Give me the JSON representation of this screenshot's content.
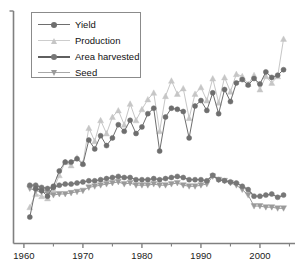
{
  "chart_data": {
    "type": "line",
    "title": "",
    "xlabel": "",
    "ylabel": "",
    "xlim": [
      1959.0,
      2005.6
    ],
    "ylim": [
      0,
      100
    ],
    "grid": false,
    "legend_position": "top-left",
    "x_tick_labels": [
      "1960",
      "1970",
      "1980",
      "1990",
      "2000"
    ],
    "x_ticks": [
      1960,
      1970,
      1980,
      1990,
      2000
    ],
    "x_minor_ticks": [
      1965,
      1975,
      1985,
      1995,
      2005
    ],
    "y_tick_labels": [],
    "x": [
      1961,
      1962,
      1963,
      1964,
      1965,
      1966,
      1967,
      1968,
      1969,
      1970,
      1971,
      1972,
      1973,
      1974,
      1975,
      1976,
      1977,
      1978,
      1979,
      1980,
      1981,
      1982,
      1983,
      1984,
      1985,
      1986,
      1987,
      1988,
      1989,
      1990,
      1991,
      1992,
      1993,
      1994,
      1995,
      1996,
      1997,
      1998,
      1999,
      2000,
      2001,
      2002,
      2003,
      2004
    ],
    "series": [
      {
        "name": "Yield",
        "color": "#6e6e6e",
        "marker": "circle",
        "values": [
          9.5,
          22.5,
          21.5,
          19.0,
          23.5,
          30.5,
          34.5,
          34.5,
          36.0,
          33.5,
          44.5,
          40.5,
          46.5,
          42.0,
          45.5,
          51.5,
          48.5,
          53.5,
          47.5,
          50.5,
          56.5,
          59.0,
          39.5,
          55.0,
          59.0,
          58.5,
          57.5,
          45.5,
          60.0,
          62.5,
          58.0,
          66.0,
          56.5,
          67.5,
          62.0,
          70.5,
          72.0,
          69.5,
          72.5,
          70.0,
          75.5,
          73.0,
          74.0,
          76.5
        ]
      },
      {
        "name": "Production",
        "color": "#c6c6c6",
        "marker": "triangle-up",
        "values": [
          14.0,
          20.0,
          19.0,
          18.0,
          22.0,
          28.5,
          34.5,
          33.0,
          36.5,
          34.0,
          50.0,
          44.0,
          53.5,
          47.5,
          55.0,
          58.0,
          51.5,
          61.0,
          53.5,
          58.5,
          63.0,
          66.0,
          48.5,
          64.5,
          71.5,
          65.5,
          68.0,
          54.5,
          65.5,
          68.5,
          62.5,
          72.5,
          61.5,
          73.0,
          66.5,
          74.5,
          73.5,
          70.0,
          74.0,
          67.5,
          73.5,
          70.5,
          73.5,
          90.5
        ]
      },
      {
        "name": "Area harvested",
        "color": "#777777",
        "marker": "circle",
        "values": [
          24.0,
          24.0,
          23.0,
          22.5,
          23.0,
          24.0,
          24.5,
          24.5,
          25.0,
          25.5,
          26.0,
          26.0,
          26.5,
          27.0,
          27.5,
          28.0,
          27.5,
          27.5,
          26.5,
          26.5,
          26.5,
          27.0,
          26.5,
          27.0,
          27.5,
          28.0,
          27.5,
          26.5,
          26.5,
          26.5,
          26.0,
          28.5,
          26.5,
          26.0,
          25.5,
          25.0,
          23.5,
          22.0,
          19.0,
          19.0,
          19.5,
          20.0,
          18.5,
          19.5
        ]
      },
      {
        "name": "Seed",
        "color": "#9a9a9a",
        "marker": "triangle-down",
        "values": [
          22.5,
          21.5,
          21.0,
          20.5,
          19.5,
          20.0,
          20.0,
          20.5,
          21.0,
          21.5,
          23.0,
          23.5,
          24.0,
          24.5,
          25.0,
          25.5,
          24.5,
          25.0,
          24.0,
          24.0,
          24.0,
          24.5,
          24.0,
          24.0,
          24.5,
          25.0,
          24.0,
          23.5,
          23.5,
          24.0,
          24.5,
          28.0,
          26.5,
          26.0,
          25.0,
          24.0,
          22.0,
          19.5,
          14.5,
          14.5,
          14.0,
          14.0,
          13.5,
          13.5
        ]
      }
    ]
  },
  "legend": {
    "entries": [
      {
        "label": "Yield",
        "marker": "circle-icon",
        "color": "#6e6e6e"
      },
      {
        "label": "Production",
        "marker": "triangle-up-icon",
        "color": "#c6c6c6"
      },
      {
        "label": "Area harvested",
        "marker": "circle-icon",
        "color": "#777777"
      },
      {
        "label": "Seed",
        "marker": "triangle-down-icon",
        "color": "#9a9a9a"
      }
    ]
  },
  "axis": {
    "line_color": "#808080"
  }
}
